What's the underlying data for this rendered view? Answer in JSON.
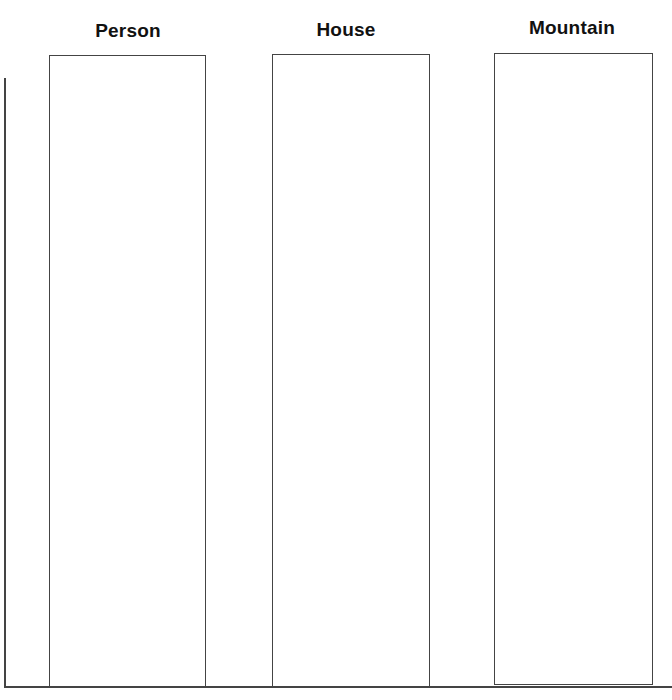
{
  "worksheet": {
    "columns": [
      {
        "title": "Person"
      },
      {
        "title": "House"
      },
      {
        "title": "Mountain"
      }
    ],
    "colors": {
      "line": "#444444",
      "text": "#111111",
      "background": "#ffffff"
    }
  }
}
